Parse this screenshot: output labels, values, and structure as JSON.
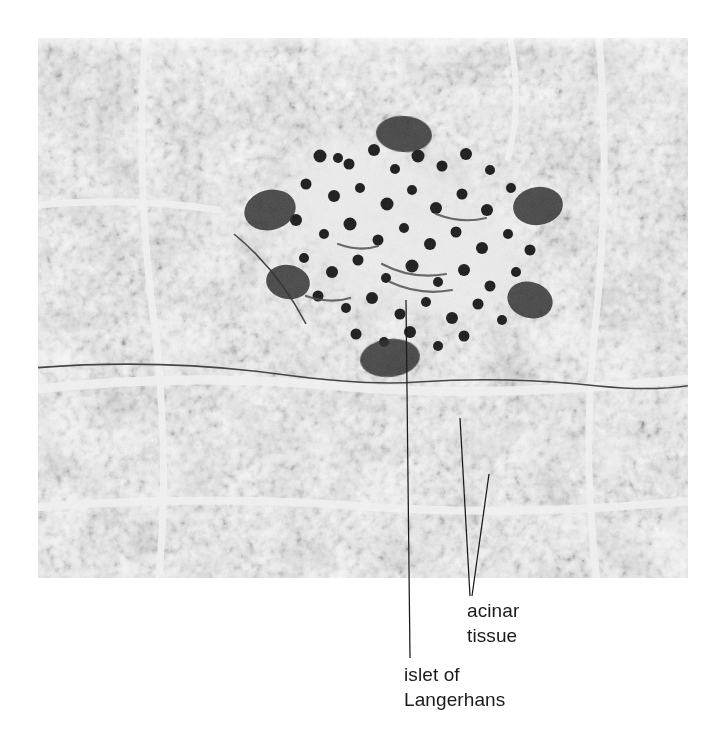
{
  "figure": {
    "kind": "light-micrograph",
    "stain_appearance": "black-and-white halftone print",
    "plate": {
      "x": 38,
      "y": 38,
      "width": 650,
      "height": 540,
      "border": "none"
    },
    "background_color": "#ffffff",
    "ink_color": "#1a1a1a"
  },
  "annotations": [
    {
      "id": "acinar",
      "name": "acinar-tissue",
      "lines": [
        "acinar",
        "tissue"
      ],
      "text_x": 467,
      "text_y": 598,
      "leaders": [
        {
          "from_x": 460,
          "from_y": 418,
          "to_x": 470,
          "to_y": 596
        },
        {
          "from_x": 489,
          "from_y": 474,
          "to_x": 472,
          "to_y": 596
        }
      ]
    },
    {
      "id": "islet",
      "name": "islet-of-langerhans",
      "lines": [
        "islet of",
        "Langerhans"
      ],
      "text_x": 404,
      "text_y": 662,
      "leaders": [
        {
          "from_x": 406,
          "from_y": 300,
          "to_x": 410,
          "to_y": 658
        }
      ]
    }
  ],
  "regions": {
    "islet_of_langerhans": {
      "label": "islet of Langerhans",
      "description": "pale rounded region of endocrine cells near image center with sparse dark nuclei",
      "center_x": 400,
      "center_y": 230,
      "radius_x": 135,
      "radius_y": 105
    },
    "acinar_tissue": {
      "label": "acinar tissue",
      "description": "darkly stained exocrine lobules filling the remainder of the field, separated by pale septa"
    }
  },
  "tones": {
    "acinus_dark": "#1b1b1b",
    "acinus_mid": "#3a3a3a",
    "septum_light": "#f2f2f2",
    "islet_pale": "#dcdcdc",
    "nucleus": "#121212",
    "plate_base": "#c8c8c8"
  }
}
